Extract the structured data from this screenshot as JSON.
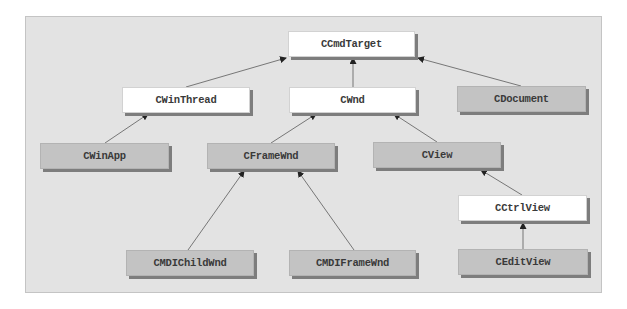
{
  "diagram": {
    "title": "",
    "colors": {
      "panel_background": "#e3e3e3",
      "base_class_fill": "#ffffff",
      "derived_class_fill": "#c3c3c3",
      "shadow": "#7d7d7d",
      "edge": "#6a6a6a"
    },
    "nodes": [
      {
        "id": "CCmdTarget",
        "label": "CCmdTarget",
        "style": "white",
        "x": 288,
        "y": 31,
        "w": 127,
        "h": 26
      },
      {
        "id": "CWinThread",
        "label": "CWinThread",
        "style": "white",
        "x": 122,
        "y": 87,
        "w": 128,
        "h": 26
      },
      {
        "id": "CWnd",
        "label": "CWnd",
        "style": "white",
        "x": 289,
        "y": 87,
        "w": 127,
        "h": 26
      },
      {
        "id": "CDocument",
        "label": "CDocument",
        "style": "gray",
        "x": 457,
        "y": 86,
        "w": 129,
        "h": 26
      },
      {
        "id": "CWinApp",
        "label": "CWinApp",
        "style": "gray",
        "x": 40,
        "y": 143,
        "w": 129,
        "h": 26
      },
      {
        "id": "CFrameWnd",
        "label": "CFrameWnd",
        "style": "gray",
        "x": 207,
        "y": 143,
        "w": 128,
        "h": 26
      },
      {
        "id": "CView",
        "label": "CView",
        "style": "gray",
        "x": 373,
        "y": 142,
        "w": 128,
        "h": 26
      },
      {
        "id": "CCtrlView",
        "label": "CCtrlView",
        "style": "white",
        "x": 458,
        "y": 195,
        "w": 129,
        "h": 26
      },
      {
        "id": "CMDIChildWnd",
        "label": "CMDIChildWnd",
        "style": "gray",
        "x": 126,
        "y": 250,
        "w": 128,
        "h": 26
      },
      {
        "id": "CMDIFrameWnd",
        "label": "CMDIFrameWnd",
        "style": "gray",
        "x": 289,
        "y": 250,
        "w": 127,
        "h": 26
      },
      {
        "id": "CEditView",
        "label": "CEditView",
        "style": "gray",
        "x": 458,
        "y": 249,
        "w": 130,
        "h": 26
      }
    ],
    "edges": [
      {
        "from": "CWinThread",
        "to": "CCmdTarget",
        "x1": 186,
        "y1": 87,
        "x2": 286,
        "y2": 58
      },
      {
        "from": "CWnd",
        "to": "CCmdTarget",
        "x1": 353,
        "y1": 87,
        "x2": 353,
        "y2": 58
      },
      {
        "from": "CDocument",
        "to": "CCmdTarget",
        "x1": 521,
        "y1": 86,
        "x2": 418,
        "y2": 58
      },
      {
        "from": "CWinApp",
        "to": "CWinThread",
        "x1": 105,
        "y1": 143,
        "x2": 148,
        "y2": 114
      },
      {
        "from": "CFrameWnd",
        "to": "CWnd",
        "x1": 271,
        "y1": 143,
        "x2": 316,
        "y2": 114
      },
      {
        "from": "CView",
        "to": "CWnd",
        "x1": 437,
        "y1": 142,
        "x2": 394,
        "y2": 114
      },
      {
        "from": "CMDIChildWnd",
        "to": "CFrameWnd",
        "x1": 188,
        "y1": 250,
        "x2": 244,
        "y2": 171
      },
      {
        "from": "CMDIFrameWnd",
        "to": "CFrameWnd",
        "x1": 354,
        "y1": 250,
        "x2": 298,
        "y2": 171
      },
      {
        "from": "CCtrlView",
        "to": "CView",
        "x1": 522,
        "y1": 195,
        "x2": 481,
        "y2": 170
      },
      {
        "from": "CEditView",
        "to": "CCtrlView",
        "x1": 523,
        "y1": 249,
        "x2": 523,
        "y2": 223
      }
    ]
  }
}
